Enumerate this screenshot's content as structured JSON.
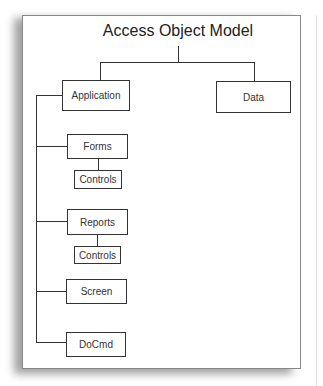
{
  "diagram": {
    "title": "Access Object Model",
    "nodes": {
      "application": "Application",
      "data": "Data",
      "forms": "Forms",
      "forms_controls": "Controls",
      "reports": "Reports",
      "reports_controls": "Controls",
      "screen": "Screen",
      "docmd": "DoCmd"
    },
    "edges": [
      [
        "Access Object Model",
        "Application"
      ],
      [
        "Access Object Model",
        "Data"
      ],
      [
        "Application",
        "Forms"
      ],
      [
        "Forms",
        "Controls"
      ],
      [
        "Application",
        "Reports"
      ],
      [
        "Reports",
        "Controls"
      ],
      [
        "Application",
        "Screen"
      ],
      [
        "Application",
        "DoCmd"
      ]
    ],
    "colors": {
      "line": "#333333",
      "background": "#ffffff",
      "frame": "#888888"
    }
  }
}
